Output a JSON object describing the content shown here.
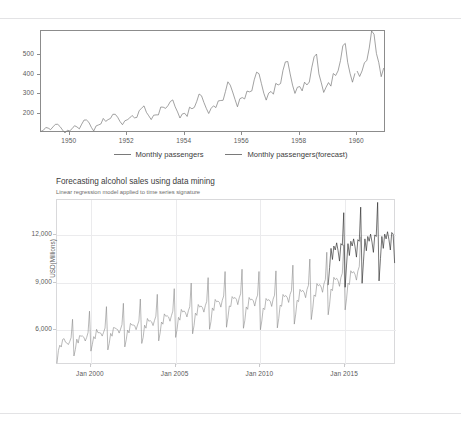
{
  "page": {
    "background_color": "#ffffff",
    "divider_color": "#e3e3e5"
  },
  "figures": [
    {
      "id": "passengers",
      "legend": [
        {
          "label": "Monthly passengers",
          "color": "#7a7a7a"
        },
        {
          "label": "Monthly passengers(forecast)",
          "color": "#7a7a7a"
        }
      ]
    },
    {
      "id": "alcohol",
      "title": "Forecasting alcohol sales using data mining",
      "subtitle": "Linear regression model applied to time series signature",
      "ylabel": "USD(Millions)"
    }
  ],
  "chart_data": [
    {
      "type": "line",
      "id": "monthly-passengers",
      "title": "",
      "xlabel": "",
      "ylabel": "",
      "xlim": [
        1949.0,
        1961.0
      ],
      "ylim": [
        104,
        622
      ],
      "xticks": [
        "1950",
        "1952",
        "1954",
        "1956",
        "1958",
        "1960"
      ],
      "xtick_values": [
        1950,
        1952,
        1954,
        1956,
        1958,
        1960
      ],
      "yticks": [
        "200",
        "300",
        "400",
        "500"
      ],
      "ytick_values": [
        200,
        300,
        400,
        500
      ],
      "grid": false,
      "legend_position": "bottom",
      "series": [
        {
          "name": "Monthly passengers",
          "color": "#7a7a7a",
          "x_start": 1949.0,
          "x_step": 0.0833333,
          "values": [
            112,
            118,
            132,
            129,
            121,
            135,
            148,
            148,
            136,
            119,
            104,
            118,
            115,
            126,
            141,
            135,
            125,
            149,
            170,
            170,
            158,
            133,
            114,
            140,
            145,
            150,
            178,
            163,
            172,
            178,
            199,
            199,
            184,
            162,
            146,
            166,
            171,
            180,
            193,
            181,
            183,
            218,
            230,
            242,
            209,
            191,
            172,
            194,
            196,
            196,
            236,
            235,
            229,
            243,
            264,
            272,
            237,
            211,
            180,
            201,
            204,
            188,
            235,
            227,
            234,
            264,
            302,
            293,
            259,
            229,
            203,
            229,
            242,
            233,
            267,
            269,
            270,
            315,
            364,
            347,
            312,
            274,
            237,
            278,
            284,
            277,
            317,
            313,
            318,
            374,
            413,
            405,
            355,
            306,
            271,
            306,
            315,
            301,
            356,
            348,
            355,
            422,
            465,
            467,
            404,
            347,
            305,
            336,
            340,
            318,
            362,
            348,
            363,
            435,
            491,
            505,
            404,
            359,
            310,
            337,
            360,
            342,
            406,
            396,
            420,
            472,
            548,
            559,
            463,
            407,
            362,
            405
          ]
        },
        {
          "name": "Monthly passengers(forecast)",
          "color": "#7a7a7a",
          "x_start": 1960.0,
          "x_step": 0.0833333,
          "values": [
            417,
            391,
            419,
            461,
            472,
            535,
            622,
            606,
            508,
            461,
            390,
            432
          ]
        }
      ]
    },
    {
      "type": "line",
      "id": "alcohol-sales",
      "title": "Forecasting alcohol sales using data mining",
      "subtitle": "Linear regression model applied to time series signature",
      "xlabel": "",
      "ylabel": "USD(Millions)",
      "xlim": [
        "Jan 1998",
        "Dec 2017"
      ],
      "ylim": [
        3800,
        14200
      ],
      "xticks": [
        "Jan 2000",
        "Jan 2005",
        "Jan 2010",
        "Jan 2015"
      ],
      "yticks": [
        "6,000",
        "9,000",
        "12,000"
      ],
      "ytick_values": [
        6000,
        9000,
        12000
      ],
      "grid": true,
      "legend_position": "none",
      "series": [
        {
          "name": "Alcohol sales (actual)",
          "color": "#8a8a8a",
          "x_start": 1998.0,
          "x_step": 0.0833333,
          "values": [
            3934,
            4725,
            5046,
            4932,
            5411,
            5462,
            5240,
            5189,
            5086,
            5274,
            5523,
            6680,
            4370,
            4780,
            5427,
            5181,
            5653,
            5617,
            5630,
            5550,
            5312,
            5534,
            5855,
            7193,
            4673,
            5090,
            5589,
            5451,
            6052,
            5838,
            5838,
            5807,
            5623,
            5865,
            6128,
            7479,
            4752,
            5173,
            5793,
            5616,
            6160,
            6137,
            6077,
            6025,
            5811,
            6059,
            6345,
            7689,
            4942,
            5382,
            6000,
            5823,
            6426,
            6322,
            6320,
            6278,
            6027,
            6318,
            6576,
            7960,
            5158,
            5540,
            6308,
            6121,
            6733,
            6561,
            6595,
            6518,
            6284,
            6600,
            6879,
            8253,
            5321,
            5820,
            6510,
            6373,
            7022,
            6872,
            6906,
            6824,
            6559,
            6905,
            7193,
            8612,
            5539,
            6035,
            6803,
            6628,
            7303,
            7138,
            7211,
            7090,
            6830,
            7220,
            7477,
            8961,
            5768,
            6276,
            7068,
            6931,
            7613,
            7450,
            7523,
            7414,
            7133,
            7537,
            7808,
            9307,
            6051,
            6541,
            7396,
            7237,
            7932,
            7785,
            7831,
            7738,
            7449,
            7876,
            8147,
            9690,
            6180,
            6775,
            7520,
            7485,
            8111,
            7993,
            8055,
            7943,
            7603,
            8032,
            8286,
            9835,
            6115,
            6623,
            7459,
            7310,
            8056,
            7903,
            7953,
            7840,
            7515,
            7957,
            8200,
            9693,
            6022,
            6573,
            7386,
            7297,
            7992,
            7866,
            7920,
            7806,
            7491,
            7951,
            8196,
            9733,
            6140,
            6744,
            7570,
            7499,
            8245,
            8112,
            8178,
            8056,
            7743,
            8241,
            8485,
            10093,
            6379,
            7009,
            7877,
            7796,
            8563,
            8430,
            8505,
            8365,
            8043,
            8554,
            8819,
            10479,
            6664,
            7310,
            8215,
            8126,
            8932,
            8790,
            8872,
            8717,
            8384,
            8918,
            9186,
            10906,
            6965,
            7632,
            8583,
            8490,
            9326,
            9180,
            9268,
            9103,
            8758,
            9310,
            9585,
            11373,
            7274,
            7969,
            8957,
            8869,
            9742,
            9592,
            9686,
            9507,
            9150,
            9727,
            10005,
            11866
          ]
        },
        {
          "name": "Alcohol sales (forecast)",
          "color": "#2b2b2b",
          "x_start": 2014.0,
          "x_step": 0.0833333,
          "values": [
            8860,
            9950,
            11150,
            10450,
            11300,
            11050,
            11500,
            11000,
            10350,
            11450,
            11350,
            13400,
            8700,
            10100,
            11450,
            10700,
            11600,
            11300,
            11750,
            11250,
            10600,
            11700,
            11600,
            13750,
            8950,
            10350,
            11750,
            11000,
            11900,
            11600,
            12050,
            11550,
            10900,
            12000,
            11900,
            14050,
            9100,
            10500,
            11900,
            11150,
            12050,
            11750,
            12200,
            11700,
            11050,
            12150,
            12050,
            10250
          ]
        }
      ]
    }
  ]
}
